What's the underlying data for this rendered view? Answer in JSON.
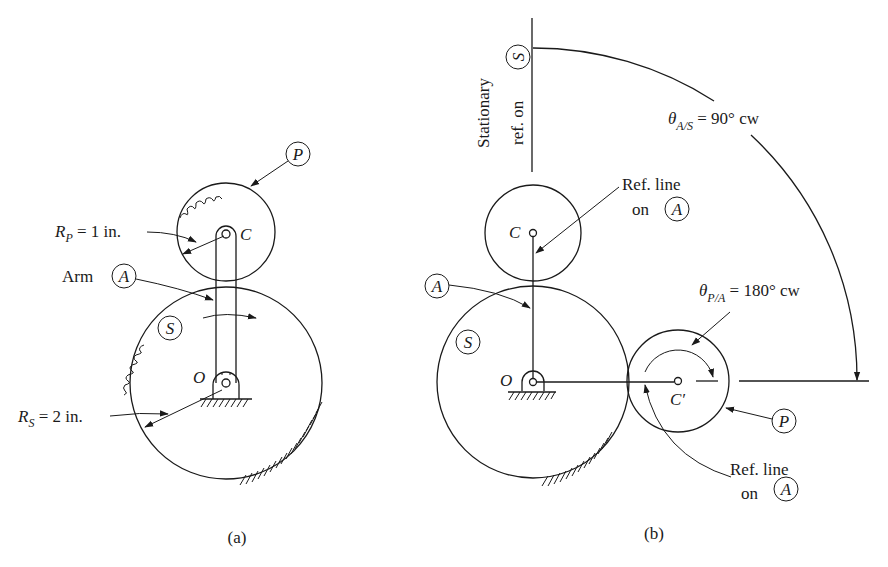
{
  "figure": {
    "panels": [
      {
        "id": "a",
        "caption": "(a)",
        "labels": {
          "planet_circle": "P",
          "sun_circle": "S",
          "arm_prefix": "Arm",
          "arm_circle": "A",
          "pivot_c": "C",
          "pivot_o": "O",
          "rp_symbol": "R",
          "rp_sub": "P",
          "rp_value": " = 1 in.",
          "rs_symbol": "R",
          "rs_sub": "S",
          "rs_value": " = 2 in."
        }
      },
      {
        "id": "b",
        "caption": "(b)",
        "labels": {
          "stationary_line1": "Stationary",
          "stationary_line2": "ref. on",
          "stationary_circle": "S",
          "theta_as_symbol": "θ",
          "theta_as_sub": "A/S",
          "theta_as_value": " = 90°  cw",
          "theta_pa_symbol": "θ",
          "theta_pa_sub": "P/A",
          "theta_pa_value": " = 180°  cw",
          "refline_top_1": "Ref. line",
          "refline_top_2": "on",
          "refline_top_circle": "A",
          "refline_bottom_1": "Ref. line",
          "refline_bottom_2": "on",
          "refline_bottom_circle": "A",
          "arm_circle": "A",
          "sun_circle": "S",
          "planet_circle": "P",
          "pivot_c": "C",
          "pivot_c_prime": "C′",
          "pivot_o": "O"
        }
      }
    ]
  }
}
